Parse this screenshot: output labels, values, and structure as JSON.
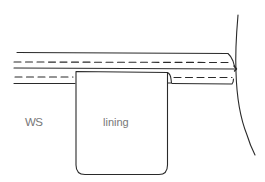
{
  "diagram": {
    "title": "",
    "labels": {
      "wrong_side": "WS",
      "lining": "lining"
    },
    "colors": {
      "stroke": "#2a2a2a",
      "label_text": "#777777",
      "background": "#ffffff"
    },
    "elements": {
      "fabric_layers": 2,
      "stitching_lines": 2,
      "lining_panel": 1,
      "garment_edge_curve": 1
    }
  }
}
